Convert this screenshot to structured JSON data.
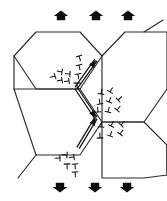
{
  "figure": {
    "title": "Hexagonal grain structure with grain-boundary dislocations under applied load",
    "background_color": "#ffffff",
    "line_color": "#2b2b2b",
    "symbol_color": "#141414",
    "load_arrow_color": "#0d0d0d",
    "width": 167,
    "height": 201
  },
  "load_arrows": {
    "top": {
      "direction": "up",
      "count": 3,
      "positions": [
        {
          "cx": 61,
          "cy": 15
        },
        {
          "cx": 96,
          "cy": 15
        },
        {
          "cx": 128,
          "cy": 15
        }
      ],
      "label": "applied-load-top"
    },
    "bottom": {
      "direction": "down",
      "count": 3,
      "positions": [
        {
          "cx": 60,
          "cy": 188
        },
        {
          "cx": 95,
          "cy": 188
        },
        {
          "cx": 127,
          "cy": 188
        }
      ],
      "label": "applied-load-bottom"
    }
  },
  "grains": [
    {
      "name": "grain-upper-left",
      "points": "14,56 36,32 80,32 102,56 80,89 36,89"
    },
    {
      "name": "grain-lower-left",
      "points": "14,89 36,89 80,89 102,122 80,155 36,155"
    },
    {
      "name": "grain-upper-right",
      "points": "102,56 125,32 167,32 167,89 144,122 102,122"
    },
    {
      "name": "grain-lower-right",
      "points": "102,122 144,122 167,145 167,175 144,178 102,178"
    }
  ],
  "grain_edge_stubs": [
    {
      "name": "stub-top-right",
      "x1": 144,
      "y1": 32,
      "x2": 163,
      "y2": 20
    },
    {
      "name": "stub-left-upper",
      "x1": 14,
      "y1": 56,
      "x2": 14,
      "y2": 89
    },
    {
      "name": "stub-bottom-left",
      "x1": 36,
      "y1": 155,
      "x2": 18,
      "y2": 178
    },
    {
      "name": "stub-right-lower",
      "x1": 167,
      "y1": 145,
      "x2": 167,
      "y2": 175
    }
  ],
  "slip_bands": [
    {
      "name": "slip-band-upper",
      "description": "Double-line slip band with arrowhead at upper triple junction",
      "x1": 96,
      "y1": 60,
      "x2": 76,
      "y2": 88,
      "arrow_at": "start"
    },
    {
      "name": "slip-band-middle",
      "description": "Double-line slip band with arrowhead below upper junction",
      "x1": 76,
      "y1": 88,
      "x2": 96,
      "y2": 118,
      "arrow_at": "end"
    },
    {
      "name": "slip-band-lower",
      "description": "Double-line slip band with arrowhead at lower triple junction",
      "x1": 96,
      "y1": 118,
      "x2": 78,
      "y2": 148,
      "arrow_at": "start"
    }
  ],
  "dislocation_clusters": [
    {
      "name": "dislocation-cluster-upper-left",
      "count": 9,
      "symbol": "perpendicular-tee",
      "symbols": [
        {
          "x": 55,
          "y": 76,
          "rot": -108,
          "s": 4.2
        },
        {
          "x": 62,
          "y": 80,
          "rot": -100,
          "s": 4.0
        },
        {
          "x": 69,
          "y": 81,
          "rot": -96,
          "s": 4.0
        },
        {
          "x": 62,
          "y": 72,
          "rot": -80,
          "s": 4.2
        },
        {
          "x": 70,
          "y": 74,
          "rot": -88,
          "s": 4.0
        },
        {
          "x": 77,
          "y": 83,
          "rot": 178,
          "s": 4.4
        },
        {
          "x": 78,
          "y": 74,
          "rot": 172,
          "s": 4.2
        },
        {
          "x": 79,
          "y": 65,
          "rot": 168,
          "s": 4.2
        },
        {
          "x": 79,
          "y": 56,
          "rot": 162,
          "s": 4.2
        }
      ]
    },
    {
      "name": "dislocation-cluster-middle-right",
      "count": 8,
      "symbol": "perpendicular-tee",
      "symbols": [
        {
          "x": 101,
          "y": 94,
          "rot": 10,
          "s": 4.2
        },
        {
          "x": 110,
          "y": 92,
          "rot": 30,
          "s": 4.2
        },
        {
          "x": 100,
          "y": 104,
          "rot": -8,
          "s": 4.2
        },
        {
          "x": 109,
          "y": 102,
          "rot": 22,
          "s": 4.2
        },
        {
          "x": 118,
          "y": 100,
          "rot": 48,
          "s": 4.2
        },
        {
          "x": 98,
          "y": 112,
          "rot": -4,
          "s": 4.2
        },
        {
          "x": 108,
          "y": 112,
          "rot": 14,
          "s": 4.2
        },
        {
          "x": 117,
          "y": 110,
          "rot": 40,
          "s": 4.2
        }
      ]
    },
    {
      "name": "dislocation-cluster-lower-right",
      "count": 6,
      "symbol": "perpendicular-tee",
      "symbols": [
        {
          "x": 101,
          "y": 127,
          "rot": 6,
          "s": 4.2
        },
        {
          "x": 111,
          "y": 126,
          "rot": 28,
          "s": 4.2
        },
        {
          "x": 121,
          "y": 125,
          "rot": 44,
          "s": 4.2
        },
        {
          "x": 100,
          "y": 138,
          "rot": -2,
          "s": 4.2
        },
        {
          "x": 110,
          "y": 136,
          "rot": 20,
          "s": 4.2
        },
        {
          "x": 120,
          "y": 134,
          "rot": 38,
          "s": 4.2
        }
      ]
    },
    {
      "name": "dislocation-cluster-bottom-left",
      "count": 6,
      "symbol": "perpendicular-tee",
      "symbols": [
        {
          "x": 60,
          "y": 158,
          "rot": -92,
          "s": 4.2
        },
        {
          "x": 67,
          "y": 155,
          "rot": -86,
          "s": 4.2
        },
        {
          "x": 74,
          "y": 157,
          "rot": -96,
          "s": 4.2
        },
        {
          "x": 67,
          "y": 164,
          "rot": 178,
          "s": 4.2
        },
        {
          "x": 75,
          "y": 164,
          "rot": 176,
          "s": 4.2
        },
        {
          "x": 75,
          "y": 172,
          "rot": 174,
          "s": 4.2
        }
      ]
    }
  ]
}
